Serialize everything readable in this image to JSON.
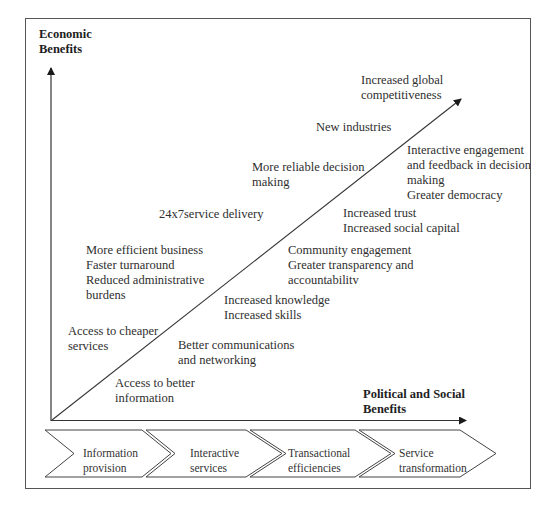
{
  "diagram": {
    "type": "e-government benefits staged diagram",
    "y_axis": {
      "title_lines": [
        "Economic",
        "Benefits"
      ]
    },
    "x_axis": {
      "title_lines": [
        "Political and Social",
        "Benefits"
      ]
    },
    "economic_labels": [
      {
        "id": "access-cheaper-services",
        "lines": [
          "Access to cheaper",
          "services"
        ]
      },
      {
        "id": "efficient-business",
        "lines": [
          "More efficient business",
          "Faster turnaround",
          "Reduced administrative",
          "burdens"
        ]
      },
      {
        "id": "service-delivery-24x7",
        "lines": [
          "24x7service delivery"
        ]
      },
      {
        "id": "reliable-decision-making",
        "lines": [
          "More reliable decision",
          "making"
        ]
      },
      {
        "id": "new-industries",
        "lines": [
          "New industries"
        ]
      },
      {
        "id": "global-competitiveness",
        "lines": [
          "Increased global",
          "competitiveness"
        ]
      }
    ],
    "social_labels": [
      {
        "id": "access-better-information",
        "lines": [
          "Access to better",
          "information"
        ]
      },
      {
        "id": "better-communications",
        "lines": [
          "Better communications",
          "and networking"
        ]
      },
      {
        "id": "knowledge-skills",
        "lines": [
          "Increased knowledge",
          "Increased skills"
        ]
      },
      {
        "id": "community-engagement",
        "lines": [
          "Community engagement",
          "Greater transparency and",
          "accountabilitv"
        ]
      },
      {
        "id": "trust-social-capital",
        "lines": [
          "Increased trust",
          "Increased social capital"
        ]
      },
      {
        "id": "interactive-engagement",
        "lines": [
          "Interactive engagement",
          "and feedback in decision",
          "making",
          "Greater democracy"
        ]
      }
    ],
    "stages": [
      {
        "id": "information-provision",
        "lines": [
          "Information",
          "provision"
        ]
      },
      {
        "id": "interactive-services",
        "lines": [
          "Interactive",
          "services"
        ]
      },
      {
        "id": "transactional-efficiencies",
        "lines": [
          "Transactional",
          "efficiencies"
        ]
      },
      {
        "id": "service-transformation",
        "lines": [
          "Service",
          "transformation"
        ]
      }
    ],
    "colors": {
      "line": "#3a3a3a",
      "frame": "#555555",
      "text": "#2e2e2e"
    }
  }
}
